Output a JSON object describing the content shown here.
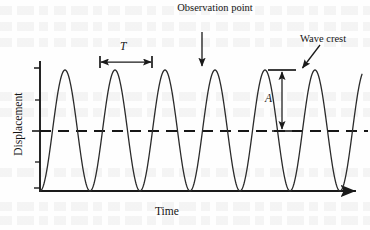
{
  "figure": {
    "kind": "wave-displacement-vs-time-graph",
    "axes": {
      "y_label": "Displacement",
      "x_label": "Time",
      "x_axis_has_arrowhead": true,
      "y_axis_has_ticks": true,
      "y_tick_count": 5
    },
    "annotations": {
      "observation_point": "Observation point",
      "observation_point_line1": "Observation",
      "observation_point_line2": "point",
      "wave_crest": "Wave crest",
      "period_symbol": "T",
      "amplitude_symbol": "A"
    },
    "colors": {
      "ink": "#1a1a1a",
      "curve": "#2b2b2b",
      "axis": "#1a1a1a",
      "equilibrium_dash": "#171717",
      "background": "#fefefe"
    }
  },
  "chart_data": {
    "type": "line",
    "title": "",
    "xlabel": "Time",
    "ylabel": "Displacement",
    "subtitle": "",
    "grid": false,
    "legend": "none",
    "axis_tick_labels": {
      "x": [],
      "y": []
    },
    "waveform": {
      "shape": "sinusoid",
      "cycles_drawn": 6.6,
      "period_px": 50,
      "amplitude_px": 60,
      "equilibrium_y_px": 131,
      "crest_y_px": 70,
      "trough_y_px": 191,
      "start_x_px": 40,
      "end_x_px": 362,
      "crest_x_px": [
        50,
        100,
        150,
        200,
        250,
        300,
        350
      ],
      "trough_x_px": [
        75,
        125,
        175,
        225,
        275,
        325
      ]
    },
    "markers": [
      {
        "name": "period-marker",
        "symbol": "T",
        "orientation": "horizontal",
        "meaning": "one full wave period between successive crests",
        "x_from_px": 100,
        "x_to_px": 152,
        "y_px": 62
      },
      {
        "name": "amplitude-marker",
        "symbol": "A",
        "orientation": "vertical",
        "meaning": "crest height above equilibrium",
        "x_px": 282,
        "y_from_px": 70,
        "y_to_px": 131
      },
      {
        "name": "observation-point-arrow",
        "label": "Observation point",
        "orientation": "vertical-down",
        "x_px": 202,
        "y_from_px": 34,
        "y_to_px": 66
      },
      {
        "name": "wave-crest-arrow",
        "label": "Wave crest",
        "orientation": "diagonal-down-left",
        "x_from_px": 318,
        "y_from_px": 46,
        "x_to_px": 302,
        "y_to_px": 70
      }
    ],
    "equilibrium_line": {
      "style": "dashed",
      "y_px": 131,
      "x_from_px": 40,
      "x_to_px": 368
    }
  }
}
